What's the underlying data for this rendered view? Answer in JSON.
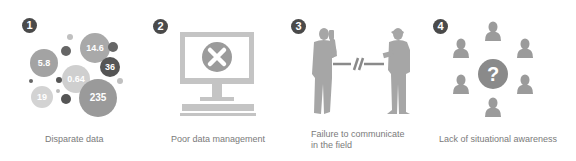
{
  "panels": [
    {
      "number": "1",
      "caption": "Disparate data",
      "illustration": "bubble-cluster",
      "bubbles": [
        {
          "label": "14.6",
          "x": 95,
          "y": 48,
          "r": 15,
          "color": "#a9a9a9",
          "font": 9
        },
        {
          "label": "5.8",
          "x": 44,
          "y": 63,
          "r": 14,
          "color": "#a3a3a3",
          "font": 9
        },
        {
          "label": "36",
          "x": 110,
          "y": 67,
          "r": 10,
          "color": "#555555",
          "font": 9
        },
        {
          "label": "0.64",
          "x": 76,
          "y": 79,
          "r": 14,
          "color": "#cfcfcf",
          "font": 9
        },
        {
          "label": "19",
          "x": 42,
          "y": 97,
          "r": 11,
          "color": "#d3d3d3",
          "font": 9
        },
        {
          "label": "235",
          "x": 98,
          "y": 98,
          "r": 19,
          "color": "#9a9a9a",
          "font": 10
        },
        {
          "label": "",
          "x": 70,
          "y": 37,
          "r": 3,
          "color": "#c0c0c0",
          "font": 0
        },
        {
          "label": "",
          "x": 66,
          "y": 51,
          "r": 5,
          "color": "#666666",
          "font": 0
        },
        {
          "label": "",
          "x": 113,
          "y": 47,
          "r": 5,
          "color": "#666666",
          "font": 0
        },
        {
          "label": "",
          "x": 59,
          "y": 80,
          "r": 3,
          "color": "#555555",
          "font": 0
        },
        {
          "label": "",
          "x": 31,
          "y": 81,
          "r": 2,
          "color": "#666666",
          "font": 0
        },
        {
          "label": "",
          "x": 120,
          "y": 81,
          "r": 3,
          "color": "#c0c0c0",
          "font": 0
        },
        {
          "label": "",
          "x": 58,
          "y": 91,
          "r": 2,
          "color": "#bbbbbb",
          "font": 0
        },
        {
          "label": "",
          "x": 66,
          "y": 99,
          "r": 5,
          "color": "#555555",
          "font": 0
        }
      ]
    },
    {
      "number": "2",
      "caption": "Poor data management",
      "illustration": "computer-error"
    },
    {
      "number": "3",
      "caption_line1": "Failure to communicate",
      "caption_line2": "in the field",
      "illustration": "broken-communication"
    },
    {
      "number": "4",
      "caption": "Lack of situational awareness",
      "illustration": "people-question",
      "center_symbol": "?"
    }
  ],
  "colors": {
    "badge": "#4a4a4a",
    "icon_gray": "#9b9b9b",
    "icon_light": "#c4c4c4",
    "caption": "#7a7a7a"
  }
}
